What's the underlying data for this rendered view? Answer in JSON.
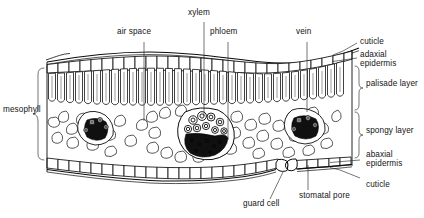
{
  "figure": {
    "kind": "botanical-line-drawing",
    "background_color": "#ffffff",
    "ink_color": "#111111",
    "leader_color": "#2a2a2a"
  },
  "labels": {
    "air_space": "air space",
    "xylem": "xylem",
    "phloem": "phloem",
    "vein": "vein",
    "cuticle_top": "cuticle",
    "adaxial_epidermis_line1": "adaxial",
    "adaxial_epidermis_line2": "epidermis",
    "palisade_layer": "palisade layer",
    "mesophyll": "mesophyll",
    "spongy_layer": "spongy layer",
    "abaxial_epidermis_line1": "abaxial",
    "abaxial_epidermis_line2": "epidermis",
    "cuticle_bottom": "cuticle",
    "guard_cell": "guard cell",
    "stomatal_pore": "stomatal pore"
  },
  "structures": [
    {
      "name": "cuticle",
      "position": "upper and lower outermost layer",
      "label": "cuticle"
    },
    {
      "name": "adaxial-epidermis",
      "position": "upper surface",
      "label": "adaxial epidermis"
    },
    {
      "name": "palisade-layer",
      "position": "upper mesophyll",
      "label": "palisade layer"
    },
    {
      "name": "spongy-layer",
      "position": "lower mesophyll",
      "label": "spongy layer"
    },
    {
      "name": "mesophyll",
      "position": "between epidermal layers",
      "label": "mesophyll"
    },
    {
      "name": "air-space",
      "position": "within spongy mesophyll",
      "label": "air space"
    },
    {
      "name": "vein",
      "position": "vascular bundle",
      "label": "vein"
    },
    {
      "name": "xylem",
      "position": "upper part of vascular bundle",
      "label": "xylem"
    },
    {
      "name": "phloem",
      "position": "lower part of vascular bundle",
      "label": "phloem"
    },
    {
      "name": "abaxial-epidermis",
      "position": "lower surface",
      "label": "abaxial epidermis"
    },
    {
      "name": "guard-cell",
      "position": "lower epidermis flanking stoma",
      "label": "guard cell"
    },
    {
      "name": "stomatal-pore",
      "position": "opening in lower epidermis",
      "label": "stomatal pore"
    }
  ],
  "brackets": [
    {
      "name": "mesophyll-brace",
      "side": "left",
      "label": "mesophyll"
    },
    {
      "name": "palisade-brace",
      "side": "right",
      "label": "palisade layer"
    },
    {
      "name": "spongy-brace",
      "side": "right",
      "label": "spongy layer"
    }
  ]
}
